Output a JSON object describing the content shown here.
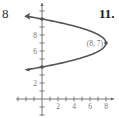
{
  "page": {
    "left_margin_number": "8",
    "problem_number": "11."
  },
  "colors": {
    "curve": "#555555",
    "axis": "#666666",
    "text": "#777777"
  },
  "chart_data": {
    "type": "line",
    "title": "",
    "xlabel": "",
    "ylabel": "",
    "equation": "x = -(8/9)(y - 7)^2 + 8",
    "xlim": [
      -3,
      9
    ],
    "ylim": [
      -1,
      12
    ],
    "grid": false,
    "x_ticks": [
      2,
      4,
      6,
      8
    ],
    "y_ticks": [
      2,
      6,
      8
    ],
    "x_tick_labels": [
      "2",
      "4",
      "6",
      "8"
    ],
    "y_tick_labels": [
      "2",
      "6",
      "8"
    ],
    "series": [
      {
        "name": "parabola",
        "points": [
          [
            -2,
            10.35
          ],
          [
            0,
            10
          ],
          [
            4.44,
            9
          ],
          [
            7.11,
            8
          ],
          [
            8,
            7
          ],
          [
            7.11,
            6
          ],
          [
            4.44,
            5
          ],
          [
            0,
            4
          ],
          [
            -2,
            3.65
          ]
        ]
      }
    ],
    "annotations": [
      {
        "text": "(8, 7)",
        "x": 8,
        "y": 7,
        "type": "vertex-label"
      }
    ],
    "marked_points": [
      {
        "x": 8,
        "y": 7
      },
      {
        "x": 0,
        "y": 10
      },
      {
        "x": 0,
        "y": 4
      }
    ]
  }
}
